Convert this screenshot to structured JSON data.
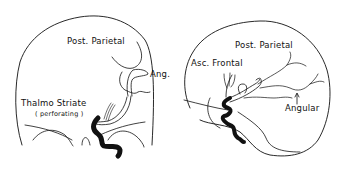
{
  "diagram": {
    "left_view": {
      "name": "frontal-view",
      "labels": {
        "post_parietal": "Post. Parietal",
        "angular": "Ang.",
        "thalmo_striate": "Thalmo Striate",
        "perforating": "( perforating )"
      }
    },
    "right_view": {
      "name": "lateral-view",
      "labels": {
        "post_parietal": "Post. Parietal",
        "asc_frontal": "Asc. Frontal",
        "angular": "Angular"
      }
    },
    "colors": {
      "line": "#111111",
      "background": "#ffffff"
    }
  }
}
